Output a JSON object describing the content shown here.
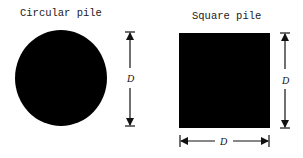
{
  "figure": {
    "panels": [
      {
        "title": "Circular pile",
        "shape": "circle",
        "fill": "#000000",
        "dimension_label": "D",
        "dimension_orientation": "vertical"
      },
      {
        "title": "Square pile",
        "shape": "square",
        "fill": "#000000",
        "dimension_labels": [
          "D",
          "D"
        ],
        "dimension_orientations": [
          "vertical",
          "horizontal"
        ]
      }
    ]
  }
}
